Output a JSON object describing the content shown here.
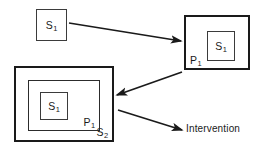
{
  "diagram": {
    "background_color": "#ffffff",
    "stroke_color": "#1a1a1a",
    "canvas": {
      "width": 260,
      "height": 154
    },
    "nodes": [
      {
        "id": "initial-state",
        "label_text": "S",
        "label_subscript": "1",
        "label_position": "center",
        "border": "thin",
        "x": 36,
        "y": 9,
        "width": 31,
        "height": 32
      },
      {
        "id": "perturbed-system",
        "label_text": "P",
        "label_subscript": "1",
        "label_position": "bottom-left",
        "border": "thick",
        "x": 184,
        "y": 15,
        "width": 66,
        "height": 55
      },
      {
        "id": "perturbed-system-inner-state",
        "label_text": "S",
        "label_subscript": "1",
        "label_position": "center",
        "border": "thin",
        "x": 207,
        "y": 31,
        "width": 28,
        "height": 30
      },
      {
        "id": "second-system",
        "label_text": "S",
        "label_subscript": "2",
        "label_position": "bottom-right",
        "border": "thick",
        "x": 14,
        "y": 66,
        "width": 100,
        "height": 76
      },
      {
        "id": "second-system-perturbation",
        "label_text": "P",
        "label_subscript": "1",
        "label_position": "bottom-right",
        "border": "med",
        "x": 28,
        "y": 80,
        "width": 72,
        "height": 51
      },
      {
        "id": "second-system-inner-state",
        "label_text": "S",
        "label_subscript": "1",
        "label_position": "center",
        "border": "thin",
        "x": 40,
        "y": 92,
        "width": 28,
        "height": 28
      }
    ],
    "arrows": [
      {
        "id": "arrow-initial-to-perturbed",
        "x1": 69,
        "y1": 23,
        "x2": 181,
        "y2": 41
      },
      {
        "id": "arrow-perturbed-to-second-system",
        "x1": 182,
        "y1": 72,
        "x2": 117,
        "y2": 95
      },
      {
        "id": "arrow-second-system-to-intervention",
        "x1": 118,
        "y1": 110,
        "x2": 182,
        "y2": 130
      }
    ],
    "sink_label": {
      "id": "intervention",
      "text": "Intervention",
      "x": 186,
      "y": 124
    }
  }
}
